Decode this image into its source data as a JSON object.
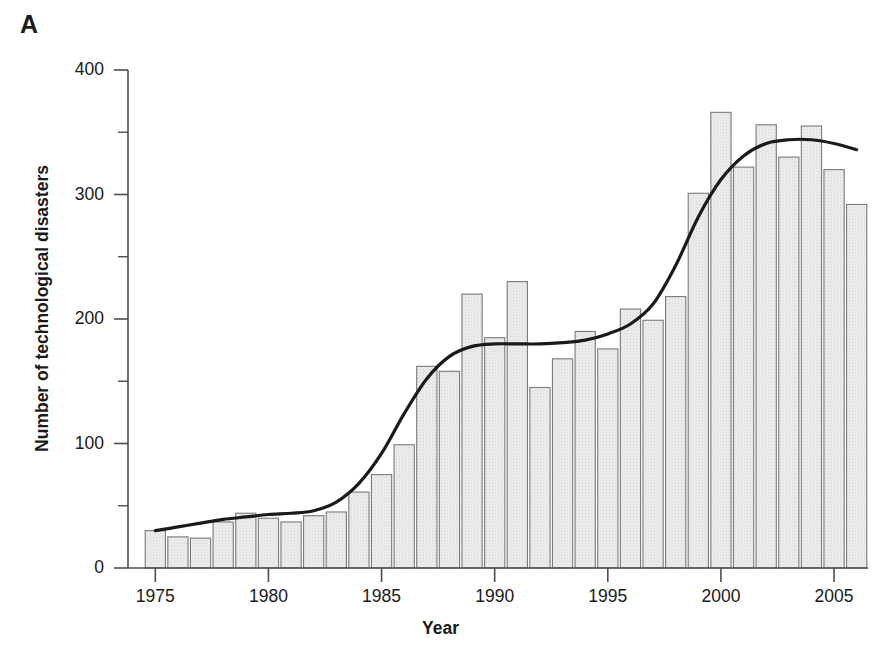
{
  "panel": {
    "label": "A"
  },
  "chart_data": {
    "type": "bar",
    "title": "",
    "subtitle": "",
    "xlabel": "Year",
    "ylabel": "Number of technological disasters",
    "xlim": [
      1974.3,
      1946.7
    ],
    "ylim": [
      0,
      400
    ],
    "grid": false,
    "legend": null,
    "y_ticks": [
      0,
      100,
      200,
      300,
      400
    ],
    "y_minor_ticks": [
      50,
      150,
      250,
      350
    ],
    "y_tick_labels": [
      "0",
      "100",
      "200",
      "300",
      "400"
    ],
    "x_ticks": [
      1975,
      1980,
      1985,
      1990,
      1995,
      2000,
      2005
    ],
    "x_tick_labels": [
      "1975",
      "1980",
      "1985",
      "1990",
      "1995",
      "2000",
      "2005"
    ],
    "categories": [
      1975,
      1976,
      1977,
      1978,
      1979,
      1980,
      1981,
      1982,
      1983,
      1984,
      1985,
      1986,
      1987,
      1988,
      1989,
      1990,
      1991,
      1992,
      1993,
      1994,
      1995,
      1996,
      1997,
      1998,
      1999,
      2000,
      2001,
      2002,
      2003,
      2004,
      2005,
      2006
    ],
    "values": [
      30,
      25,
      24,
      37,
      44,
      40,
      37,
      42,
      45,
      61,
      75,
      99,
      162,
      158,
      220,
      185,
      230,
      145,
      168,
      190,
      176,
      208,
      199,
      218,
      301,
      366,
      322,
      356,
      330,
      355,
      320,
      292
    ],
    "series": [
      {
        "name": "Number of technological disasters",
        "type": "bar",
        "values": [
          30,
          25,
          24,
          37,
          44,
          40,
          37,
          42,
          45,
          61,
          75,
          99,
          162,
          158,
          220,
          185,
          230,
          145,
          168,
          190,
          176,
          208,
          199,
          218,
          301,
          366,
          322,
          356,
          330,
          355,
          320,
          292
        ]
      },
      {
        "name": "Smoothed trend",
        "type": "line",
        "x": [
          1975,
          1976,
          1977,
          1978,
          1979,
          1980,
          1981,
          1982,
          1983,
          1984,
          1985,
          1986,
          1987,
          1988,
          1989,
          1990,
          1991,
          1992,
          1993,
          1994,
          1995,
          1996,
          1997,
          1998,
          1999,
          2000,
          2001,
          2002,
          2003,
          2004,
          2005,
          2006
        ],
        "values": [
          30,
          33,
          36,
          39,
          41,
          43,
          44,
          46,
          53,
          68,
          92,
          124,
          152,
          170,
          178,
          180,
          180,
          180,
          181,
          183,
          188,
          196,
          212,
          243,
          282,
          312,
          331,
          341,
          344,
          344,
          341,
          336
        ]
      }
    ],
    "bar_style": {
      "fill": "#e9e9e9",
      "edge": "#7a7a7a",
      "pattern": "stipple"
    },
    "line_style": {
      "color": "#1a1a1a",
      "width": 3.2
    },
    "axis_color": "#4d4d4d"
  }
}
